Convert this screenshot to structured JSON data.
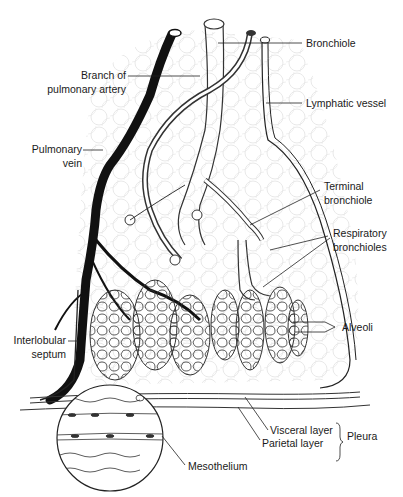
{
  "figure": {
    "labels": {
      "branch_of_pulmonary_artery_1": "Branch of",
      "branch_of_pulmonary_artery_2": "pulmonary artery",
      "pulmonary_vein_1": "Pulmonary",
      "pulmonary_vein_2": "vein",
      "bronchiole": "Bronchiole",
      "lymphatic_vessel": "Lymphatic vessel",
      "terminal_bronchiole_1": "Terminal",
      "terminal_bronchiole_2": "bronchiole",
      "respiratory_bronchioles_1": "Respiratory",
      "respiratory_bronchioles_2": "bronchioles",
      "alveoli": "Alveoli",
      "interlobular_septum_1": "Interlobular",
      "interlobular_septum_2": "septum",
      "visceral_layer": "Visceral layer",
      "parietal_layer": "Parietal layer",
      "pleura": "Pleura",
      "mesothelium": "Mesothelium"
    },
    "colors": {
      "ink": "#1a1a1a",
      "background": "#ffffff",
      "texture": "#d9d9d9"
    }
  }
}
